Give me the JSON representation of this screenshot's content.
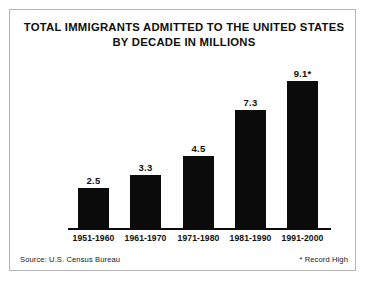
{
  "figure": {
    "border_color": "#b4b4b4",
    "background": "#ffffff"
  },
  "title": {
    "line1": "TOTAL IMMIGRANTS ADMITTED TO THE UNITED STATES",
    "line2": "BY DECADE IN MILLIONS"
  },
  "footer": {
    "source": "Source: U.S. Census Bureau",
    "note": "* Record High"
  },
  "chart_data": {
    "type": "bar",
    "title": "TOTAL IMMIGRANTS ADMITTED TO THE UNITED STATES BY DECADE IN MILLIONS",
    "xlabel": "",
    "ylabel": "Millions",
    "ylim": [
      0,
      9.1
    ],
    "grid": false,
    "legend": false,
    "bar_color": "#0b0b0b",
    "categories": [
      "1951-1960",
      "1961-1970",
      "1971-1980",
      "1981-1990",
      "1991-2000"
    ],
    "values": [
      2.5,
      3.3,
      4.5,
      7.3,
      9.1
    ],
    "data_labels": [
      "2.5",
      "3.3",
      "4.5",
      "7.3",
      "9.1*"
    ],
    "annotations": [
      {
        "category": "1991-2000",
        "marker": "*",
        "meaning": "Record High"
      }
    ],
    "source": "U.S. Census Bureau"
  }
}
